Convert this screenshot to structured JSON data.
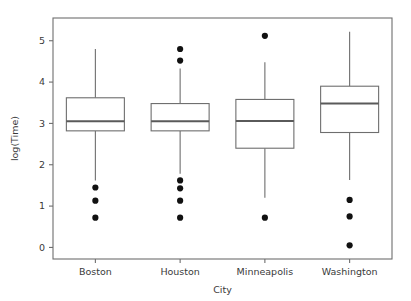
{
  "chart_data": {
    "type": "box",
    "title": "",
    "subtitle": "",
    "xlabel": "City",
    "ylabel": "log(Time)",
    "categories": [
      "Boston",
      "Houston",
      "Minneapolis",
      "Washington"
    ],
    "xtick_labels": [
      "Boston",
      "Houston",
      "Minneapolis",
      "Washington"
    ],
    "ytick_labels": [
      "0",
      "1",
      "2",
      "3",
      "4",
      "5"
    ],
    "yticks": [
      0,
      1,
      2,
      3,
      4,
      5
    ],
    "ylim": [
      -0.28,
      5.55
    ],
    "grid": false,
    "legend": null,
    "legend_position": "none",
    "orientation": "vertical",
    "boxes": [
      {
        "name": "Boston",
        "whisker_low": 1.62,
        "q1": 2.82,
        "median": 3.05,
        "q3": 3.62,
        "whisker_high": 4.8,
        "outliers": [
          1.45,
          1.13,
          0.72
        ]
      },
      {
        "name": "Houston",
        "whisker_low": 1.78,
        "q1": 2.82,
        "median": 3.05,
        "q3": 3.48,
        "whisker_high": 4.33,
        "outliers": [
          4.8,
          4.52,
          1.62,
          1.43,
          1.13,
          0.72
        ]
      },
      {
        "name": "Minneapolis",
        "whisker_low": 1.2,
        "q1": 2.4,
        "median": 3.06,
        "q3": 3.58,
        "whisker_high": 4.48,
        "outliers": [
          5.12,
          0.72
        ]
      },
      {
        "name": "Washington",
        "whisker_low": 1.63,
        "q1": 2.78,
        "median": 3.48,
        "q3": 3.9,
        "whisker_high": 5.22,
        "outliers": [
          1.15,
          0.75,
          0.05
        ]
      }
    ]
  },
  "style": {
    "frame_color": "#6e6e6e",
    "box_fill": "#ffffff",
    "box_edge": "#6e6e6e",
    "median_color": "#5a5a5a",
    "outlier_color": "#111111",
    "text_color": "#3a3a3a",
    "background": "#ffffff"
  },
  "geometry": {
    "plot_left": 53,
    "plot_right": 392,
    "plot_top": 18,
    "plot_bottom": 259,
    "box_width": 58,
    "outlier_radius": 3.1
  }
}
